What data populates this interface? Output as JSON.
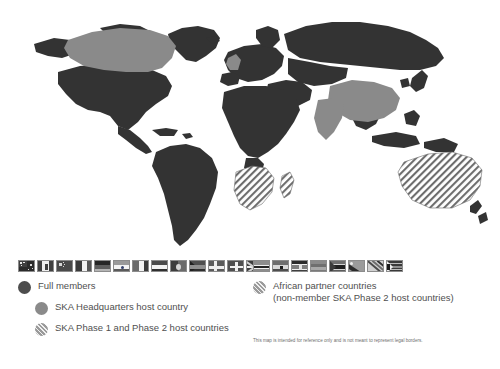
{
  "map": {
    "title": "SKA Observatory member and partner countries world map",
    "colors": {
      "background": "#ffffff",
      "non_member_land": "#333333",
      "full_member": "#4d4d4d",
      "headquarters_host": "#8a8a8a",
      "phase_host_hatch": "#9a9a9a",
      "legend_text": "#4f4f4f"
    },
    "regions": [
      {
        "name": "Canada",
        "category": "headquarters-or-member-light"
      },
      {
        "name": "China",
        "category": "headquarters-or-member-light"
      },
      {
        "name": "India",
        "category": "headquarters-or-member-light"
      },
      {
        "name": "United Kingdom",
        "category": "headquarters-host"
      },
      {
        "name": "Australia",
        "category": "phase-1-and-2-host"
      },
      {
        "name": "South Africa",
        "category": "phase-1-and-2-host"
      },
      {
        "name": "Botswana",
        "category": "african-partner"
      },
      {
        "name": "Namibia",
        "category": "african-partner"
      },
      {
        "name": "Zambia",
        "category": "african-partner"
      },
      {
        "name": "Mozambique",
        "category": "african-partner"
      },
      {
        "name": "Madagascar",
        "category": "african-partner"
      },
      {
        "name": "Kenya",
        "category": "african-partner"
      },
      {
        "name": "Ghana",
        "category": "african-partner"
      },
      {
        "name": "Mauritius",
        "category": "african-partner"
      }
    ]
  },
  "legend": {
    "members": {
      "flags": [
        {
          "name": "australia-flag",
          "label": "Australia"
        },
        {
          "name": "canada-flag",
          "label": "Canada"
        },
        {
          "name": "china-flag",
          "label": "China"
        },
        {
          "name": "france-flag",
          "label": "France"
        },
        {
          "name": "germany-flag",
          "label": "Germany"
        },
        {
          "name": "india-flag",
          "label": "India"
        },
        {
          "name": "italy-flag",
          "label": "Italy"
        },
        {
          "name": "netherlands-flag",
          "label": "Netherlands"
        },
        {
          "name": "portugal-flag",
          "label": "Portugal"
        },
        {
          "name": "south-africa-flag",
          "label": "South Africa"
        },
        {
          "name": "sweden-flag",
          "label": "Sweden"
        },
        {
          "name": "switzerland-flag",
          "label": "Switzerland"
        },
        {
          "name": "united-kingdom-flag",
          "label": "United Kingdom"
        }
      ],
      "entries": [
        {
          "marker": "solid",
          "text": "Full members"
        },
        {
          "marker": "mid",
          "text": "SKA Headquarters host country"
        },
        {
          "marker": "hatch",
          "text": "SKA Phase 1 and Phase 2 host countries"
        }
      ]
    },
    "partners": {
      "flags": [
        {
          "name": "botswana-flag",
          "label": "Botswana"
        },
        {
          "name": "ghana-flag",
          "label": "Ghana"
        },
        {
          "name": "kenya-flag",
          "label": "Kenya"
        },
        {
          "name": "mauritius-flag",
          "label": "Mauritius"
        },
        {
          "name": "mozambique-flag",
          "label": "Mozambique"
        },
        {
          "name": "namibia-flag",
          "label": "Namibia"
        },
        {
          "name": "zambia-flag",
          "label": "Zambia"
        },
        {
          "name": "zimbabwe-flag",
          "label": "Zimbabwe"
        }
      ],
      "entries": [
        {
          "marker": "hatch",
          "text": "African partner countries\n(non-member SKA Phase 2 host countries)"
        }
      ]
    }
  },
  "footnote": "This map is intended for reference only and is not meant to represent legal borders."
}
